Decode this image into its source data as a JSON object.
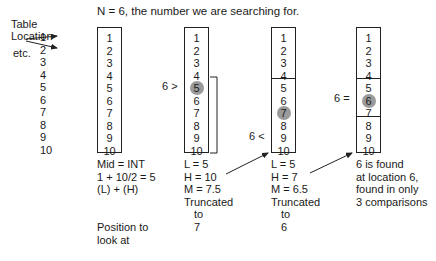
{
  "title": "N = 6, the number we are searching for.",
  "labels": {
    "table": "Table",
    "location": "Location",
    "etc": "etc."
  },
  "locations": [
    "1",
    "2",
    "3",
    "4",
    "5",
    "6",
    "7",
    "8",
    "9",
    "10"
  ],
  "boxes": [
    {
      "id": "initial",
      "values": [
        "1",
        "2",
        "3",
        "4",
        "5",
        "6",
        "7",
        "8",
        "9",
        "10"
      ],
      "highlight": null,
      "comparison": "",
      "notes": [
        "Mid = INT",
        "1 + 10/2 = 5",
        "(L) + (H)",
        "",
        "",
        "Position to",
        "look at"
      ]
    },
    {
      "id": "step1",
      "values": [
        "1",
        "2",
        "3",
        "4",
        "5",
        "6",
        "7",
        "8",
        "9",
        "10"
      ],
      "highlight": "5",
      "comparison": "6 >",
      "notes": [
        "L = 5",
        "H = 10",
        "M = 7.5",
        "Truncated",
        "to",
        "7"
      ]
    },
    {
      "id": "step2",
      "values": [
        "1",
        "2",
        "3",
        "4",
        "5",
        "6",
        "7",
        "8",
        "9",
        "10"
      ],
      "highlight": "7",
      "comparison": "6 <",
      "notes": [
        "L = 5",
        "H = 7",
        "M = 6.5",
        "Truncated",
        "to",
        "6"
      ]
    },
    {
      "id": "step3",
      "values": [
        "1",
        "2",
        "3",
        "4",
        "5",
        "6",
        "7",
        "8",
        "9",
        "10"
      ],
      "highlight": "6",
      "comparison": "6 =",
      "notes": [
        "6 is found",
        "at location 6,",
        "found in only",
        "3 comparisons"
      ]
    }
  ],
  "colors": {
    "line": "#222222",
    "highlight_circle": "#9a9a9a",
    "text": "#1a1a1a"
  }
}
